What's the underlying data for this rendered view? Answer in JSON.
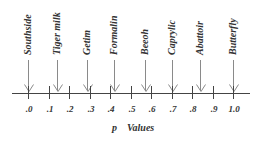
{
  "chart_data": {
    "type": "number-line",
    "xlabel": "p Values",
    "xlabel_parts": [
      "p",
      "Values"
    ],
    "ticks": [
      ".0",
      ".1",
      ".2",
      ".3",
      ".4",
      ".5",
      ".6",
      ".7",
      ".8",
      ".9",
      "1.0"
    ],
    "xlim": [
      0,
      1.0
    ],
    "markers": [
      {
        "label": "Southside",
        "value": 0.0
      },
      {
        "label": "Tiger milk",
        "value": 0.14
      },
      {
        "label": "Getim",
        "value": 0.29
      },
      {
        "label": "Formalin",
        "value": 0.42
      },
      {
        "label": "Beeoh",
        "value": 0.57
      },
      {
        "label": "Caprylic",
        "value": 0.7
      },
      {
        "label": "Abattoir",
        "value": 0.84
      },
      {
        "label": "Butterfly",
        "value": 1.0
      }
    ]
  }
}
